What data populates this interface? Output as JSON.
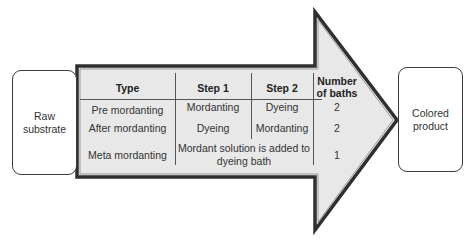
{
  "diagram": {
    "input_box": {
      "label_line1": "Raw",
      "label_line2": "substrate"
    },
    "output_box": {
      "label_line1": "Colored",
      "label_line2": "product"
    },
    "arrow": {
      "fill": "#e6e6e6",
      "stroke": "#4a4a4a"
    },
    "table": {
      "headers": {
        "type": "Type",
        "step1": "Step 1",
        "step2": "Step 2",
        "baths_line1": "Number",
        "baths_line2": "of baths"
      },
      "rows": [
        {
          "type": "Pre mordanting",
          "step1": "Mordanting",
          "step2": "Dyeing",
          "baths": "2"
        },
        {
          "type": "After mordanting",
          "step1": "Dyeing",
          "step2": "Mordanting",
          "baths": "2"
        },
        {
          "type": "Meta mordanting",
          "merged_line1": "Mordant solution is added to",
          "merged_line2": "dyeing bath",
          "baths": "1"
        }
      ]
    }
  }
}
